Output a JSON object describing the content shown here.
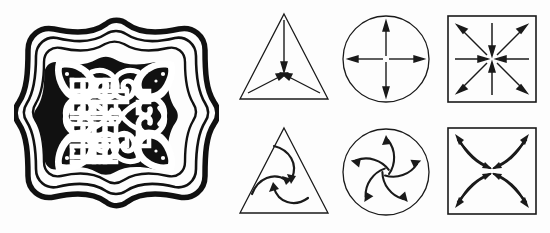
{
  "figure": {
    "name": "symmetry-comparison-figure",
    "background_color": "#fdfdfd",
    "ink_color": "#111111",
    "stroke_color": "#1a1a1a",
    "panel_count": 7
  },
  "ornament": {
    "name": "knotwork-ornament",
    "title": "Interlaced quatrefoil knotwork panel",
    "style": "black-and-white woodcut",
    "symmetry_group": "D4",
    "rotation_order": 4,
    "mirror_lines": 4,
    "chiral": false,
    "fill_color": "#111111",
    "ground_color": "#ffffff",
    "features": [
      "scalloped ogee outer border",
      "four corner leaf palmettes",
      "central interlaced lattice grid",
      "four foliate scroll quadrants"
    ]
  },
  "diagrams": {
    "rows": [
      {
        "name": "achiral-row",
        "label": "reflection-symmetric patterns",
        "chiral": false,
        "arrow_style": "straight",
        "cells": [
          {
            "name": "triangle-straight-arrows",
            "shape": "triangle",
            "rotation_order": 3,
            "mirror_lines": 3,
            "symmetry_group": "C3v",
            "arrow_count": 3,
            "arrow_direction": "inward",
            "arrow_origin": "vertices"
          },
          {
            "name": "circle-straight-arrows",
            "shape": "circle",
            "rotation_order": 4,
            "mirror_lines": 4,
            "symmetry_group": "C4v",
            "arrow_count": 4,
            "arrow_direction": "outward",
            "arrow_origin": "center"
          },
          {
            "name": "square-straight-arrows",
            "shape": "square",
            "rotation_order": 4,
            "mirror_lines": 4,
            "symmetry_group": "C4v",
            "arrow_count": 8,
            "arrow_direction": "mixed",
            "arrow_origin": "center",
            "detail": "four diagonal arrows point outward, four axial arrows point inward"
          }
        ]
      },
      {
        "name": "chiral-row",
        "label": "rotation-only pinwheel patterns",
        "chiral": true,
        "arrow_style": "curved",
        "cells": [
          {
            "name": "triangle-curved-arrows",
            "shape": "triangle",
            "rotation_order": 3,
            "mirror_lines": 0,
            "symmetry_group": "C3",
            "arrow_count": 3,
            "arrow_direction": "clockwise-spiral",
            "arrow_origin": "inward-curling"
          },
          {
            "name": "circle-curved-arrows",
            "shape": "circle",
            "rotation_order": 5,
            "mirror_lines": 0,
            "symmetry_group": "C5",
            "arrow_count": 5,
            "arrow_direction": "counterclockwise-spiral",
            "arrow_origin": "center-outward"
          },
          {
            "name": "square-curved-arrows",
            "shape": "square",
            "rotation_order": 4,
            "mirror_lines": 0,
            "symmetry_group": "C4",
            "arrow_count": 8,
            "arrow_direction": "double-petal-spiral",
            "arrow_origin": "center-and-corners",
            "detail": "four lens-shaped petals, each a pair of curved arrows pointing to corner and to center"
          }
        ]
      }
    ]
  }
}
